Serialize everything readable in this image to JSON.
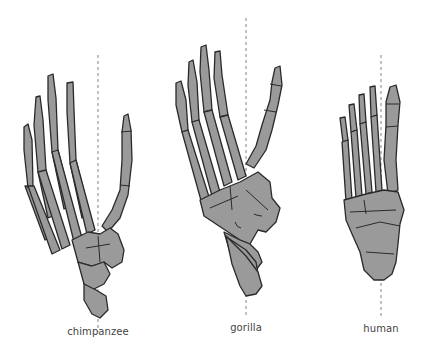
{
  "figure": {
    "type": "comparative anatomy diagram",
    "colors": {
      "bone_fill": "#9a9a9a",
      "bone_outline": "#2a2a2a",
      "axis_line": "#777777",
      "label_text": "#444444",
      "background": "#ffffff"
    }
  },
  "specimens": [
    {
      "id": "chimpanzee",
      "label": "chimpanzee",
      "axis_x": 98
    },
    {
      "id": "gorilla",
      "label": "gorilla",
      "axis_x": 246
    },
    {
      "id": "human",
      "label": "human",
      "axis_x": 381
    }
  ]
}
